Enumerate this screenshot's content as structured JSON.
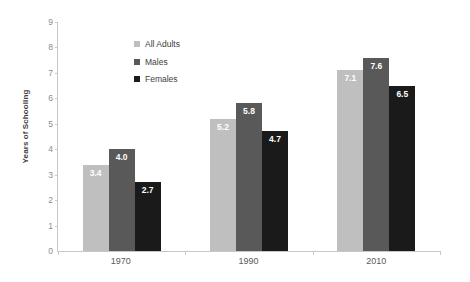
{
  "chart_data": {
    "type": "bar",
    "title": "",
    "xlabel": "",
    "ylabel": "Years of Schooling",
    "categories": [
      "1970",
      "1990",
      "2010"
    ],
    "series": [
      {
        "name": "All Adults",
        "color": "#BFBFBF",
        "values": [
          3.4,
          5.2,
          7.1
        ],
        "labels": [
          "3.4",
          "5.2",
          "7.1"
        ]
      },
      {
        "name": "Males",
        "color": "#595959",
        "values": [
          4.0,
          5.8,
          7.6
        ],
        "labels": [
          "4.0",
          "5.8",
          "7.6"
        ]
      },
      {
        "name": "Females",
        "color": "#1A1A1A",
        "values": [
          2.7,
          4.7,
          6.5
        ],
        "labels": [
          "2.7",
          "4.7",
          "6.5"
        ]
      }
    ],
    "ylim": [
      0,
      9
    ],
    "ytick_step": 1,
    "yticks": [
      "9",
      "8",
      "7",
      "6",
      "5",
      "4",
      "3",
      "2",
      "1",
      "0"
    ],
    "grid": false,
    "legend_position": "top-left-inside",
    "bar_label_position": "inside-top",
    "bar_label_color": "#FFFFFF",
    "axis_color": "#C8C8C8",
    "tick_label_color": "#8C8C8C"
  }
}
